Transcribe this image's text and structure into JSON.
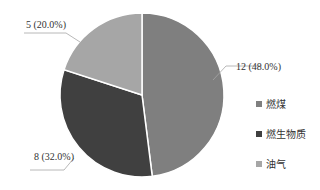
{
  "chart_data": {
    "type": "pie",
    "title": "",
    "categories": [
      "燃煤",
      "燃生物质",
      "油气"
    ],
    "values": [
      12,
      8,
      5
    ],
    "percentages": [
      48.0,
      32.0,
      20.0
    ],
    "data_labels": [
      "12 (48.0%)",
      "8 (32.0%)",
      "5 (20.0%)"
    ],
    "colors": [
      "#7f7f7f",
      "#404040",
      "#a6a6a6"
    ],
    "start_angle": "12 o'clock, clockwise",
    "legend_position": "right"
  },
  "legend": [
    {
      "label": "燃煤",
      "color": "#7f7f7f"
    },
    {
      "label": "燃生物质",
      "color": "#404040"
    },
    {
      "label": "油气",
      "color": "#a6a6a6"
    }
  ]
}
